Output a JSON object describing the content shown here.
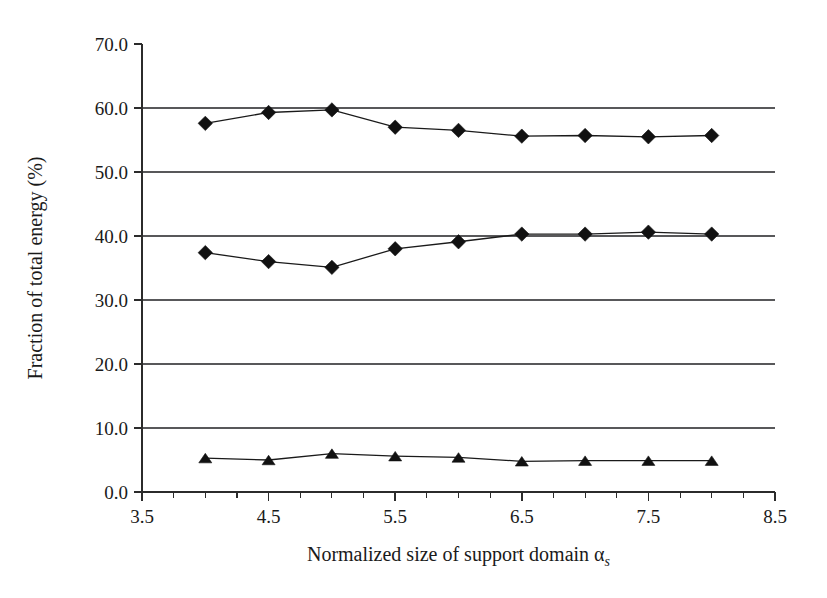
{
  "chart_data": {
    "type": "line",
    "title": "",
    "xlabel": "Normalized size of support domain α",
    "xlabel_subscript": "s",
    "ylabel": "Fraction of total energy (%)",
    "xlim": [
      3.5,
      8.5
    ],
    "ylim": [
      0.0,
      70.0
    ],
    "grid": true,
    "legend": "none",
    "x_tick_labels": [
      "3.5",
      "4.5",
      "5.5",
      "6.5",
      "7.5",
      "8.5"
    ],
    "x_tick_values": [
      3.5,
      4.5,
      5.5,
      6.5,
      7.5,
      8.5
    ],
    "x_minor_step": 0.25,
    "y_tick_labels": [
      "0.0",
      "10.0",
      "20.0",
      "30.0",
      "40.0",
      "50.0",
      "60.0",
      "70.0"
    ],
    "y_tick_values": [
      0.0,
      10.0,
      20.0,
      30.0,
      40.0,
      50.0,
      60.0,
      70.0
    ],
    "x": [
      4.0,
      4.5,
      5.0,
      5.5,
      6.0,
      6.5,
      7.0,
      7.5,
      8.0
    ],
    "series": [
      {
        "name": "series-upper",
        "marker": "diamond",
        "values": [
          57.6,
          59.3,
          59.7,
          57.0,
          56.5,
          55.6,
          55.7,
          55.5,
          55.7
        ]
      },
      {
        "name": "series-middle",
        "marker": "diamond",
        "values": [
          37.4,
          36.0,
          35.1,
          38.0,
          39.1,
          40.3,
          40.3,
          40.6,
          40.3
        ]
      },
      {
        "name": "series-lower",
        "marker": "triangle",
        "values": [
          5.3,
          5.0,
          6.0,
          5.6,
          5.4,
          4.8,
          4.9,
          4.9,
          4.9
        ]
      }
    ]
  }
}
